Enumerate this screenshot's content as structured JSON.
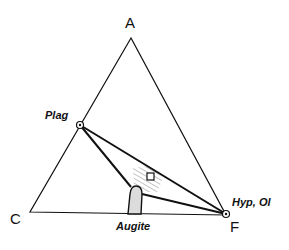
{
  "diagram": {
    "type": "ternary ACF diagram",
    "vertices": {
      "top": "A",
      "left": "C",
      "right": "F"
    },
    "phases": {
      "plag": "Plag",
      "hyp_ol": "Hyp, Ol",
      "augite": "Augite"
    },
    "colors": {
      "line": "#111111",
      "hatch": "#888888",
      "augite_fill": "#d8d8d8",
      "background": "#ffffff"
    }
  }
}
